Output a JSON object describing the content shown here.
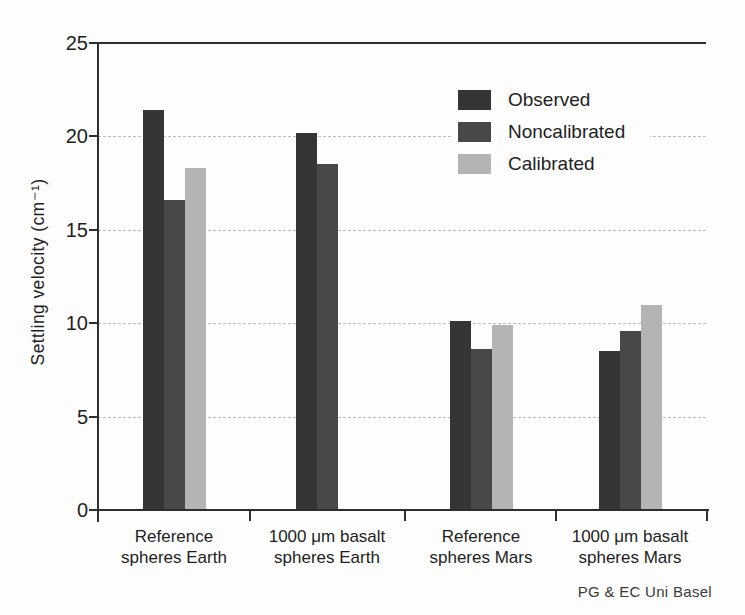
{
  "attribution": "PG & EC Uni Basel",
  "colors": {
    "axis": "#2e2e2e",
    "grid": "#bfbfbf",
    "text": "#1f1f1f",
    "background": "#fdfdfd",
    "observed": "#353535",
    "noncalibrated": "#484848",
    "calibrated": "#b4b4b4"
  },
  "chart_data": {
    "type": "bar",
    "title": "",
    "xlabel": "",
    "ylabel": "Settling velocity (cm⁻¹)",
    "ylim": [
      0,
      25
    ],
    "yticks": [
      0,
      5,
      10,
      15,
      20,
      25
    ],
    "grid": "horizontal dashed gridlines at 5, 10, 15, 20; solid line at 25; grouped bars",
    "legend_position": "upper right inside plot",
    "categories": [
      {
        "lines": [
          "Reference",
          "spheres Earth"
        ]
      },
      {
        "lines": [
          "1000 μm basalt",
          "spheres Earth"
        ]
      },
      {
        "lines": [
          "Reference",
          "spheres Mars"
        ]
      },
      {
        "lines": [
          "1000 μm basalt",
          "spheres Mars"
        ]
      }
    ],
    "series": [
      {
        "name": "Observed",
        "color": "#353535",
        "values": [
          21.4,
          20.2,
          10.1,
          8.5
        ]
      },
      {
        "name": "Noncalibrated",
        "color": "#484848",
        "values": [
          16.6,
          18.5,
          8.6,
          9.6
        ]
      },
      {
        "name": "Calibrated",
        "color": "#b4b4b4",
        "values": [
          18.3,
          null,
          9.9,
          11.0
        ]
      }
    ]
  }
}
